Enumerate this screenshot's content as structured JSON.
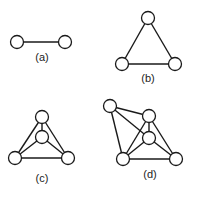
{
  "figure": {
    "colors": {
      "stroke": "#1a1a1a",
      "node_fill": "#ffffff",
      "label": "#222222"
    },
    "node_radius": 6.5,
    "graphs": [
      {
        "label": "(a)",
        "label_pos": [
          42,
          61
        ],
        "nodes": [
          [
            17,
            42
          ],
          [
            65,
            42
          ]
        ],
        "edges": [
          [
            0,
            1
          ]
        ]
      },
      {
        "label": "(b)",
        "label_pos": [
          148,
          82
        ],
        "nodes": [
          [
            148,
            18
          ],
          [
            122,
            64
          ],
          [
            175,
            64
          ]
        ],
        "edges": [
          [
            0,
            1
          ],
          [
            0,
            2
          ],
          [
            1,
            2
          ]
        ]
      },
      {
        "label": "(c)",
        "label_pos": [
          42,
          182
        ],
        "nodes": [
          [
            42,
            117
          ],
          [
            42,
            137
          ],
          [
            15,
            158
          ],
          [
            68,
            158
          ]
        ],
        "edges": [
          [
            0,
            2
          ],
          [
            0,
            3
          ],
          [
            2,
            3
          ],
          [
            0,
            1
          ],
          [
            1,
            2
          ],
          [
            1,
            3
          ]
        ]
      },
      {
        "label": "(d)",
        "label_pos": [
          150,
          178
        ],
        "nodes": [
          [
            110,
            106
          ],
          [
            149,
            116
          ],
          [
            149,
            138
          ],
          [
            123,
            159
          ],
          [
            176,
            159
          ]
        ],
        "edges": [
          [
            0,
            1
          ],
          [
            0,
            2
          ],
          [
            0,
            3
          ],
          [
            1,
            2
          ],
          [
            1,
            3
          ],
          [
            1,
            4
          ],
          [
            2,
            3
          ],
          [
            2,
            4
          ],
          [
            3,
            4
          ]
        ]
      }
    ]
  }
}
